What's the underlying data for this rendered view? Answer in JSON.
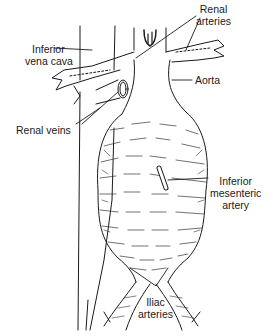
{
  "figure": {
    "labels": {
      "renal_arteries": [
        "Renal",
        "arteries"
      ],
      "inferior_vena_cava": [
        "Inferior",
        "vena cava"
      ],
      "aorta": "Aorta",
      "renal_veins": "Renal veins",
      "inferior_mesenteric_artery": [
        "Inferior",
        "mesenteric",
        "artery"
      ],
      "iliac_arteries": [
        "Iliac",
        "arteries"
      ]
    },
    "colors": {
      "ink": "#1a1a1a",
      "background": "#ffffff"
    }
  }
}
